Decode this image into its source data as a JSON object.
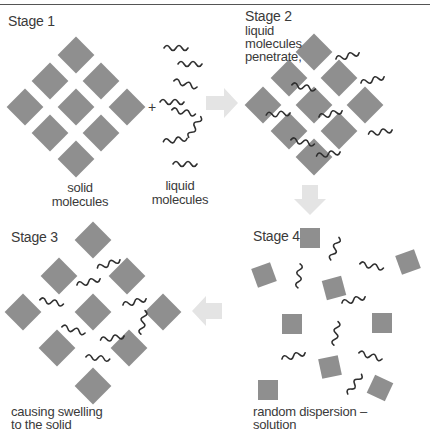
{
  "diagram": {
    "colors": {
      "molecule_fill": "#8f8f8f",
      "chain_stroke": "#2f2f2f",
      "arrow_fill": "#e4e4e4",
      "text": "#3a3a3a"
    },
    "stages": [
      {
        "id": "stage-1",
        "title": "Stage 1",
        "labels": [
          "solid molecules",
          "liquid molecules"
        ],
        "solid_label_lines": [
          "solid",
          "molecules"
        ],
        "liquid_label_lines": [
          "liquid",
          "molecules"
        ],
        "operator": "+"
      },
      {
        "id": "stage-2",
        "title": "Stage 2",
        "caption_lines": [
          "liquid",
          "molecules",
          "penetrate,"
        ]
      },
      {
        "id": "stage-3",
        "title": "Stage 3",
        "caption_lines": [
          "causing swelling",
          "to the solid"
        ]
      },
      {
        "id": "stage-4",
        "title": "Stage 4",
        "caption_lines": [
          "random dispersion –",
          "solution"
        ]
      }
    ],
    "arrows": [
      {
        "from": "stage-1",
        "to": "stage-2",
        "direction": "right"
      },
      {
        "from": "stage-2",
        "to": "stage-4",
        "direction": "down"
      },
      {
        "from": "stage-4",
        "to": "stage-3",
        "direction": "left"
      }
    ]
  }
}
